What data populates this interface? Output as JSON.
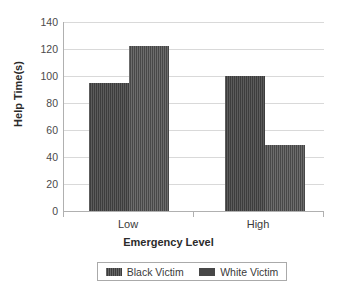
{
  "chart_data": {
    "type": "bar",
    "title": "",
    "xlabel": "Emergency Level",
    "ylabel": "Help Time(s)",
    "categories": [
      "Low",
      "High"
    ],
    "series": [
      {
        "name": "Black Victim",
        "values": [
          95,
          100
        ],
        "color": "#3d3d3d"
      },
      {
        "name": "White Victim",
        "values": [
          122,
          49
        ],
        "color": "#474747"
      }
    ],
    "ylim": [
      0,
      140
    ],
    "ytick_step": 20,
    "yticks": [
      0,
      20,
      40,
      60,
      80,
      100,
      120,
      140
    ],
    "ytick_labels": [
      "0",
      "20",
      "40",
      "60",
      "80",
      "100",
      "120",
      "140"
    ],
    "grid": "horizontal",
    "legend_position": "bottom",
    "background": "#ffffff",
    "gridline_color": "#d9d9d9",
    "axis_color": "#b0b0b0"
  }
}
